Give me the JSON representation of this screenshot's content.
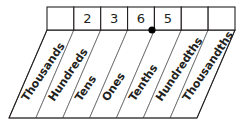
{
  "diagram": {
    "type": "place-value-chart",
    "decimal_point": {
      "symbol": ".",
      "name": "decimal-point",
      "between": [
        "Ones",
        "Tenths"
      ],
      "x": 152,
      "y": 30
    },
    "number_shown": "236.5",
    "columns": [
      {
        "label": "Thousands",
        "digit": "",
        "place_value": 1000,
        "index": 0
      },
      {
        "label": "Hundreds",
        "digit": "2",
        "place_value": 100,
        "index": 1
      },
      {
        "label": "Tens",
        "digit": "3",
        "place_value": 10,
        "index": 2
      },
      {
        "label": "Ones",
        "digit": "6",
        "place_value": 1,
        "index": 3
      },
      {
        "label": "Tenths",
        "digit": "5",
        "place_value": 0.1,
        "index": 4
      },
      {
        "label": "Hundredths",
        "digit": "",
        "place_value": 0.01,
        "index": 5
      },
      {
        "label": "Thousandths",
        "digit": "",
        "place_value": 0.001,
        "index": 6
      }
    ],
    "colors": {
      "stroke_outer": "#231f20",
      "stroke_inner": "#6d6e71",
      "text": "#231f20",
      "background": "#ffffff",
      "dot": "#000000"
    },
    "geometry": {
      "top_row": {
        "x_left": 47,
        "x_right": 235,
        "y_top": 7,
        "y_bottom": 30
      },
      "slant_row": {
        "y_top": 30,
        "y_bottom": 118,
        "shear_x": -38
      },
      "label_rotation_deg": -56
    }
  }
}
